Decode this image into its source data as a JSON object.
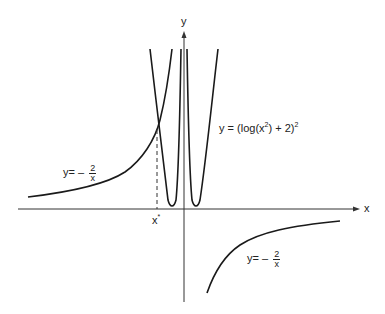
{
  "diagram": {
    "axes": {
      "x_label": "x",
      "y_label": "y"
    },
    "curves": [
      {
        "name": "hyperbola",
        "equation_lhs": "y=",
        "equation_sign": "–",
        "numerator": "2",
        "denominator": "x"
      },
      {
        "name": "log-squared",
        "equation": "y = (log(x",
        "exp_inner": "2",
        "equation_mid": ") + 2)",
        "exp_outer": "2"
      }
    ],
    "labels": {
      "left_hyperbola": {
        "lhs": "y=",
        "sign": "–",
        "num": "2",
        "den": "x"
      },
      "right_hyperbola": {
        "lhs": "y=",
        "sign": "–",
        "num": "2",
        "den": "x"
      },
      "log_curve": {
        "text": "y = (log(x",
        "sup1": "2",
        "mid": ") + 2)",
        "sup2": "2"
      },
      "x_star": {
        "text": "x",
        "sup": "*"
      }
    },
    "colors": {
      "stroke": "#1a1a1a",
      "background": "#ffffff"
    }
  }
}
